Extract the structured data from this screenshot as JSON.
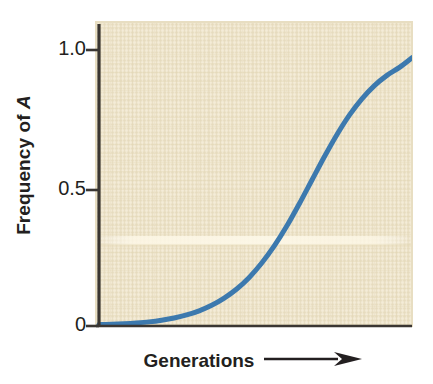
{
  "chart_data": {
    "type": "line",
    "title": "",
    "subtitle": "",
    "xlabel": "Generations",
    "xlabel_suffix_icon": "right-arrow-icon",
    "ylabel_prefix": "Frequency of ",
    "ylabel_italic": "A",
    "ylabel": "Frequency of A",
    "xlim": [
      0,
      1
    ],
    "ylim": [
      0,
      1
    ],
    "grid": false,
    "legend": null,
    "legend_position": "none",
    "x_tick_labels": [],
    "y_ticks": [
      0,
      0.5,
      1.0
    ],
    "y_tick_labels": [
      "0",
      "0.5",
      "1.0"
    ],
    "series": [
      {
        "name": "Frequency of A",
        "color": "#3c79ae",
        "line_width": 5,
        "x": [
          0.0,
          0.04,
          0.08,
          0.12,
          0.16,
          0.2,
          0.24,
          0.28,
          0.32,
          0.36,
          0.4,
          0.44,
          0.48,
          0.52,
          0.56,
          0.6,
          0.64,
          0.68,
          0.72,
          0.76,
          0.8,
          0.84,
          0.88,
          0.92,
          0.96,
          1.0
        ],
        "y": [
          0.005,
          0.006,
          0.008,
          0.011,
          0.015,
          0.021,
          0.029,
          0.04,
          0.055,
          0.075,
          0.101,
          0.134,
          0.176,
          0.228,
          0.29,
          0.362,
          0.443,
          0.528,
          0.613,
          0.693,
          0.764,
          0.823,
          0.871,
          0.908,
          0.937,
          0.972
        ]
      }
    ]
  },
  "axes": {
    "background_color": "#eee5cd",
    "axis_color": "#3a3632",
    "text_color": "#231f20",
    "tick_1_label": "1.0",
    "tick_05_label": "0.5",
    "tick_0_label": "0"
  },
  "figure": {
    "background_color": "#ffffff",
    "width": 433,
    "height": 384
  }
}
